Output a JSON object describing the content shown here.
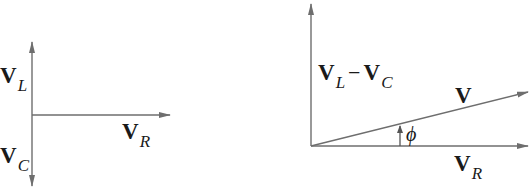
{
  "diagrams": {
    "left": {
      "labels": {
        "vl": {
          "main": "V",
          "sub": "L"
        },
        "vc": {
          "main": "V",
          "sub": "C"
        },
        "vr": {
          "main": "V",
          "sub": "R"
        }
      }
    },
    "right": {
      "labels": {
        "vlc": {
          "main1": "V",
          "sub1": "L",
          "op": "−",
          "main2": "V",
          "sub2": "C"
        },
        "v": {
          "main": "V"
        },
        "phi": "ϕ",
        "vr": {
          "main": "V",
          "sub": "R"
        }
      }
    }
  },
  "colors": {
    "line": "#6e6e6e",
    "text": "#1a1a1a",
    "background": "#ffffff"
  }
}
